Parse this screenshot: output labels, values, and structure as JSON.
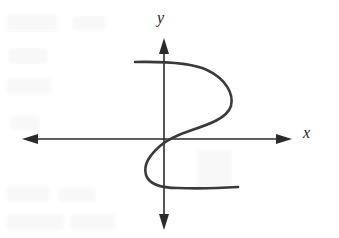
{
  "figure": {
    "kind": "cartesian-axes-graph",
    "width": 339,
    "height": 238,
    "background_color": "#ffffff",
    "axis_color": "#2b2b2b",
    "curve_color": "#3a3a3a",
    "label_color": "#1c1c1c",
    "x_axis_label": "x",
    "y_axis_label": "y"
  },
  "chart_data": {
    "type": "line",
    "title": "",
    "subtitle": "",
    "xlabel": "x",
    "ylabel": "y",
    "grid": false,
    "legend": null,
    "legend_position": "none",
    "tick_labels": {
      "x": [],
      "y": []
    },
    "axes": {
      "origin_px": [
        164,
        139
      ],
      "x_axis_y_px": 139,
      "y_axis_x_px": 164,
      "x_axis_extent_px": [
        22,
        292
      ],
      "y_axis_extent_px": [
        38,
        230
      ],
      "x_arrows": "both",
      "y_arrows": "both",
      "xlim": [
        -4.8,
        4.8
      ],
      "ylim": [
        -3.5,
        3.5
      ]
    },
    "annotations": [
      "Sideways S-shaped curve that fails the vertical line test",
      "Curve passes through the origin"
    ],
    "series": [
      {
        "name": "sideways-s-curve",
        "color": "#3a3a3a",
        "closed": false,
        "points_px": [
          [
            135,
            62
          ],
          [
            160,
            62
          ],
          [
            185,
            63
          ],
          [
            205,
            68
          ],
          [
            222,
            77
          ],
          [
            231,
            89
          ],
          [
            232,
            101
          ],
          [
            224,
            112
          ],
          [
            209,
            121
          ],
          [
            191,
            128
          ],
          [
            176,
            133
          ],
          [
            164,
            139
          ],
          [
            155,
            147
          ],
          [
            147,
            157
          ],
          [
            144,
            167
          ],
          [
            147,
            177
          ],
          [
            157,
            184
          ],
          [
            172,
            187
          ],
          [
            196,
            188
          ],
          [
            219,
            188
          ],
          [
            238,
            187
          ]
        ],
        "points_data": [
          [
            -0.52,
            2.75
          ],
          [
            -0.07,
            2.75
          ],
          [
            0.37,
            2.71
          ],
          [
            0.73,
            2.53
          ],
          [
            1.04,
            2.21
          ],
          [
            1.2,
            1.79
          ],
          [
            1.21,
            1.36
          ],
          [
            1.07,
            0.97
          ],
          [
            0.8,
            0.64
          ],
          [
            0.48,
            0.39
          ],
          [
            0.21,
            0.21
          ],
          [
            0.0,
            0.0
          ],
          [
            -0.16,
            -0.29
          ],
          [
            -0.31,
            -0.64
          ],
          [
            -0.36,
            -1.0
          ],
          [
            -0.31,
            -1.36
          ],
          [
            -0.13,
            -1.61
          ],
          [
            0.15,
            -1.71
          ],
          [
            0.58,
            -1.75
          ],
          [
            0.99,
            -1.75
          ],
          [
            1.33,
            -1.71
          ]
        ],
        "path_d": "M 135 62 C 160 61.5 190 62 207 70 C 226 79 234 94 231 106 C 227 118 210 124 192 130 C 177 135 168 139 160 146 C 150 155 143 164 146 175 C 149 184 162 188 178 188 C 200 189 222 188 238 187"
      }
    ]
  },
  "marks": {
    "x_axis_line": "horizontal-double-arrow",
    "y_axis_line": "vertical-double-arrow"
  }
}
